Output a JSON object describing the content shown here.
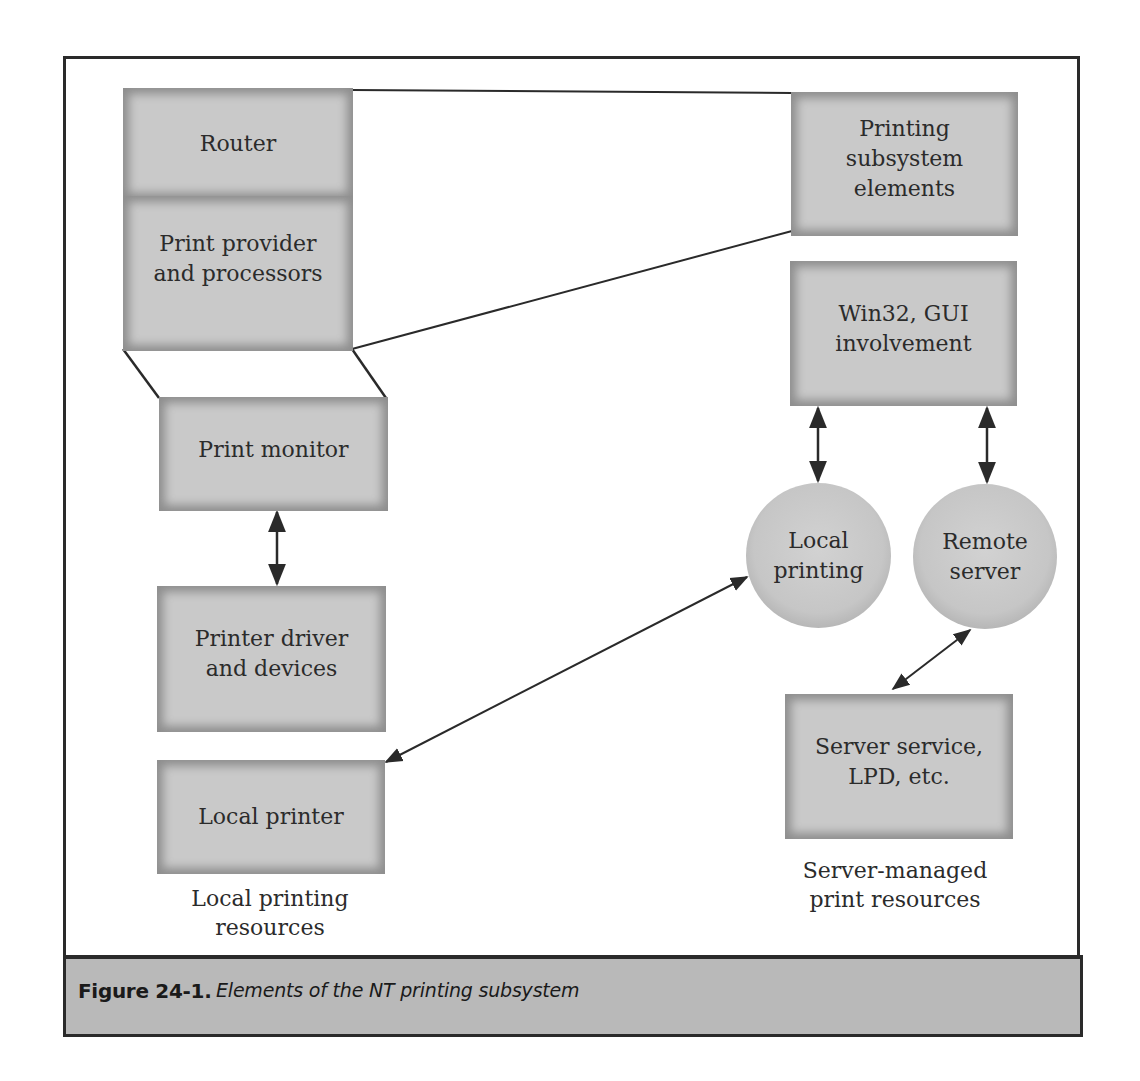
{
  "diagram": {
    "nodes": {
      "router": {
        "label": "Router"
      },
      "print_provider": {
        "label": "Print provider\nand processors"
      },
      "print_monitor": {
        "label": "Print monitor"
      },
      "printer_driver": {
        "label": "Printer driver\nand devices"
      },
      "local_printer": {
        "label": "Local printer"
      },
      "printing_subsystem": {
        "label": "Printing\nsubsystem\nelements"
      },
      "win32_gui": {
        "label": "Win32, GUI\ninvolvement"
      },
      "local_printing": {
        "label": "Local\nprinting",
        "shape": "circle"
      },
      "remote_server": {
        "label": "Remote\nserver",
        "shape": "circle"
      },
      "server_service": {
        "label": "Server service,\nLPD, etc."
      }
    },
    "group_labels": {
      "local_resources": "Local printing\nresources",
      "server_resources": "Server-managed\nprint resources"
    },
    "edges": [
      {
        "from": "router",
        "to": "printing_subsystem",
        "type": "line"
      },
      {
        "from": "print_provider",
        "to": "printing_subsystem",
        "type": "line"
      },
      {
        "from": "print_provider",
        "to": "print_monitor",
        "type": "trapezoid-lines"
      },
      {
        "from": "print_monitor",
        "to": "printer_driver",
        "type": "double-arrow"
      },
      {
        "from": "win32_gui",
        "to": "local_printing",
        "type": "double-arrow"
      },
      {
        "from": "win32_gui",
        "to": "remote_server",
        "type": "double-arrow"
      },
      {
        "from": "local_printing",
        "to": "local_printer",
        "type": "double-arrow"
      },
      {
        "from": "remote_server",
        "to": "server_service",
        "type": "double-arrow"
      }
    ]
  },
  "caption": {
    "label": "Figure 24-1.",
    "text": "Elements of the NT printing subsystem"
  },
  "colors": {
    "box_fill": "#c9c9c9",
    "box_edge": "#8e8e8e",
    "caption_bg": "#b9b9b9",
    "line": "#2a2a2a"
  }
}
